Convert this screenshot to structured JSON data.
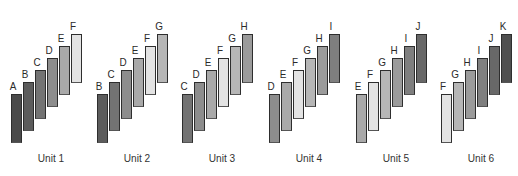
{
  "diagram": {
    "type": "staircase-bars",
    "shades": {
      "A": "#4a4a4a",
      "B": "#5c5c5c",
      "C": "#737373",
      "D": "#8d8d8d",
      "E": "#a9a9a9",
      "F": "#e3e3e3",
      "G": "#b6b6b6",
      "H": "#9b9b9b",
      "I": "#7f7f7f",
      "J": "#686868",
      "K": "#4f4f4f"
    },
    "units": [
      {
        "label": "Unit 1",
        "bars": [
          "A",
          "B",
          "C",
          "D",
          "E",
          "F"
        ]
      },
      {
        "label": "Unit 2",
        "bars": [
          "B",
          "C",
          "D",
          "E",
          "F",
          "G"
        ]
      },
      {
        "label": "Unit 3",
        "bars": [
          "C",
          "D",
          "E",
          "F",
          "G",
          "H"
        ]
      },
      {
        "label": "Unit 4",
        "bars": [
          "D",
          "E",
          "F",
          "G",
          "H",
          "I"
        ]
      },
      {
        "label": "Unit 5",
        "bars": [
          "E",
          "F",
          "G",
          "H",
          "I",
          "J"
        ]
      },
      {
        "label": "Unit 6",
        "bars": [
          "F",
          "G",
          "H",
          "I",
          "J",
          "K"
        ]
      }
    ]
  }
}
